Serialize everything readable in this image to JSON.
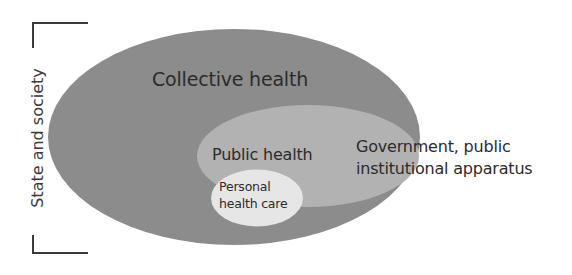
{
  "diagram": {
    "side_label": "State and society",
    "regions": [
      {
        "id": "collective",
        "label": "Collective health",
        "fill": "#8c8c8c"
      },
      {
        "id": "public",
        "label": "Public health",
        "fill": "#b2b2b2"
      },
      {
        "id": "personal",
        "label_line1": "Personal",
        "label_line2": "health care",
        "fill": "#e6e6e6"
      }
    ],
    "government_label_line1": "Government, public",
    "government_label_line2": "institutional apparatus",
    "colors": {
      "text": "#2b2b2b",
      "bracket": "#3a3a3a",
      "background": "#ffffff"
    }
  }
}
